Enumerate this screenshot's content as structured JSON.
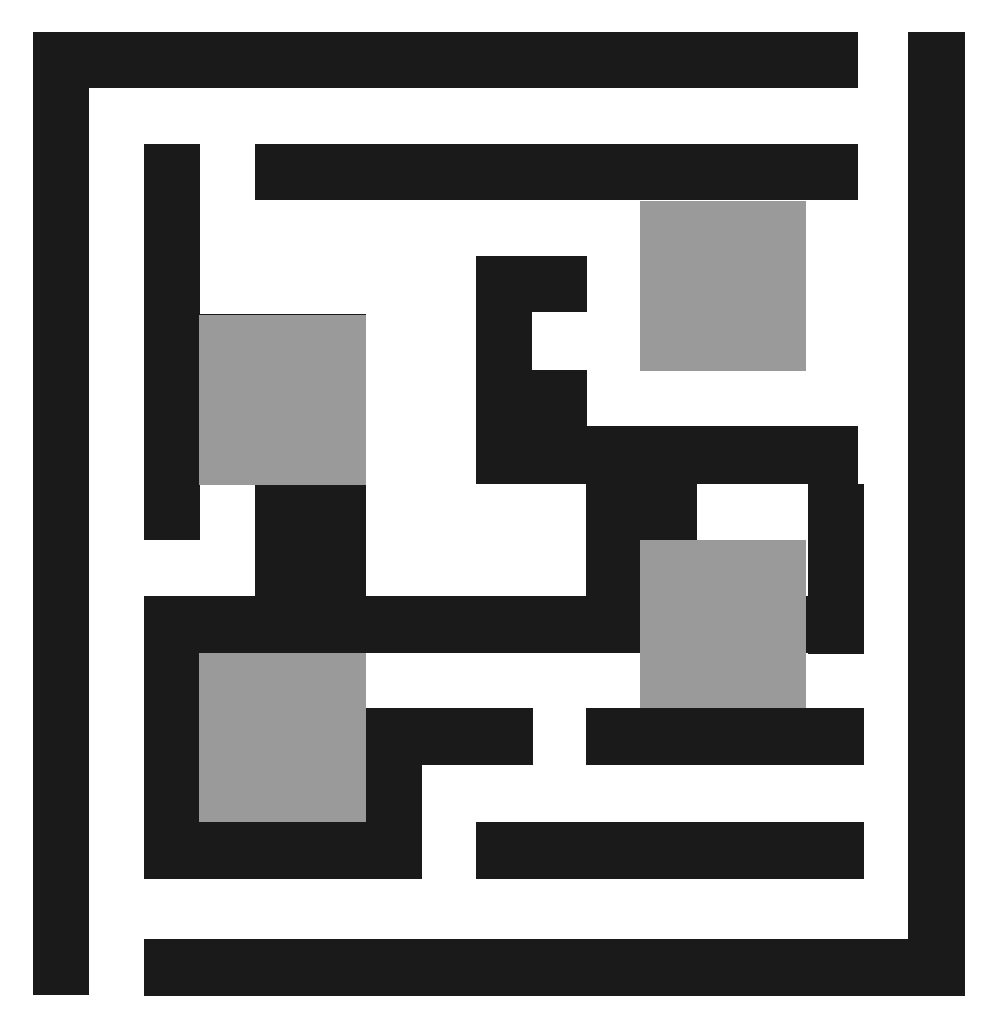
{
  "scene": {
    "kind": "maze-puzzle-grid",
    "width": 999,
    "height": 1031,
    "background_color": "#ffffff",
    "wall_color": "#1a1a1a",
    "goal_color": "#9a9a9a",
    "wall_thickness": 56,
    "cell_pitch": 111,
    "origin_x": 33,
    "origin_y": 32
  },
  "walls": [
    {
      "id": "outer-top",
      "x": 33,
      "y": 32,
      "w": 825,
      "h": 56
    },
    {
      "id": "outer-left",
      "x": 33,
      "y": 32,
      "w": 56,
      "h": 963
    },
    {
      "id": "outer-right",
      "x": 908,
      "y": 32,
      "w": 57,
      "h": 963
    },
    {
      "id": "outer-bottom",
      "x": 144,
      "y": 939,
      "w": 821,
      "h": 57
    },
    {
      "id": "w-r2-c1-vert",
      "x": 144,
      "y": 144,
      "w": 56,
      "h": 226
    },
    {
      "id": "w-r2-top-long",
      "x": 255,
      "y": 144,
      "w": 603,
      "h": 56
    },
    {
      "id": "w-r3-horiz-left",
      "x": 144,
      "y": 314,
      "w": 222,
      "h": 56
    },
    {
      "id": "w-r3-vert-mid",
      "x": 476,
      "y": 256,
      "w": 111,
      "h": 56
    },
    {
      "id": "w-r3-stub",
      "x": 476,
      "y": 256,
      "w": 56,
      "h": 228
    },
    {
      "id": "w-r4-c1-vert",
      "x": 144,
      "y": 370,
      "w": 56,
      "h": 170
    },
    {
      "id": "w-r3-c4-notch",
      "x": 476,
      "y": 370,
      "w": 111,
      "h": 56
    },
    {
      "id": "w-r4-right-bar",
      "x": 476,
      "y": 426,
      "w": 382,
      "h": 58
    },
    {
      "id": "w-r5-c3-block",
      "x": 255,
      "y": 484,
      "w": 111,
      "h": 112
    },
    {
      "id": "w-r5-c5-block",
      "x": 586,
      "y": 484,
      "w": 111,
      "h": 112
    },
    {
      "id": "w-r5-c7-block",
      "x": 808,
      "y": 484,
      "w": 56,
      "h": 170
    },
    {
      "id": "w-r6-long-horiz",
      "x": 144,
      "y": 596,
      "w": 442,
      "h": 57
    },
    {
      "id": "w-r6-c1-vert",
      "x": 144,
      "y": 596,
      "w": 56,
      "h": 283
    },
    {
      "id": "w-r6-right-horiz",
      "x": 586,
      "y": 596,
      "w": 222,
      "h": 57
    },
    {
      "id": "w-r7-c3-vert",
      "x": 366,
      "y": 708,
      "w": 56,
      "h": 115
    },
    {
      "id": "w-r7-horiz-mid",
      "x": 366,
      "y": 708,
      "w": 167,
      "h": 57
    },
    {
      "id": "w-r7-right-horiz",
      "x": 586,
      "y": 708,
      "w": 278,
      "h": 57
    },
    {
      "id": "w-r8-bottom-left",
      "x": 144,
      "y": 822,
      "w": 278,
      "h": 57
    },
    {
      "id": "w-r8-bottom-mid",
      "x": 476,
      "y": 822,
      "w": 388,
      "h": 57
    }
  ],
  "goals": [
    {
      "id": "goal-top-left",
      "x": 199,
      "y": 315,
      "w": 167,
      "h": 170
    },
    {
      "id": "goal-top-right",
      "x": 640,
      "y": 201,
      "w": 166,
      "h": 170
    },
    {
      "id": "goal-bottom-right",
      "x": 640,
      "y": 540,
      "w": 166,
      "h": 168
    },
    {
      "id": "goal-bottom-left",
      "x": 199,
      "y": 653,
      "w": 167,
      "h": 169
    }
  ]
}
